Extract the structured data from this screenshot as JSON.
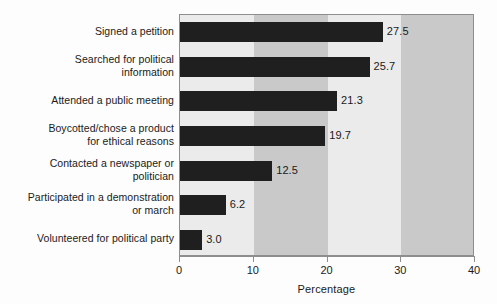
{
  "chart_data": {
    "type": "bar",
    "orientation": "horizontal",
    "title": "",
    "xlabel": "Percentage",
    "ylabel": "",
    "xlim": [
      0,
      40
    ],
    "ylim": null,
    "xticks": [
      "0",
      "10",
      "20",
      "30",
      "40"
    ],
    "grid": false,
    "legend": null,
    "bands": [
      {
        "from": 0,
        "to": 10,
        "color": "#ebebeb"
      },
      {
        "from": 10,
        "to": 20,
        "color": "#c9c9c9"
      },
      {
        "from": 20,
        "to": 30,
        "color": "#ebebeb"
      },
      {
        "from": 30,
        "to": 40,
        "color": "#c9c9c9"
      }
    ],
    "bar_color": "#1f1f1f",
    "categories": [
      "Signed a petition",
      "Searched for political\ninformation",
      "Attended a public meeting",
      "Boycotted/chose a product\nfor ethical reasons",
      "Contacted a newspaper or\npolitician",
      "Participated in a demonstration\nor march",
      "Volunteered for political party"
    ],
    "values": [
      27.5,
      25.7,
      21.3,
      19.7,
      12.5,
      6.2,
      3.0
    ],
    "value_labels": [
      "27.5",
      "25.7",
      "21.3",
      "19.7",
      "12.5",
      "6.2",
      "3.0"
    ]
  }
}
